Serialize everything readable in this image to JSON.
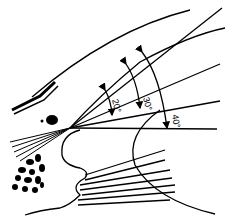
{
  "diagram": {
    "type": "anatomical-angle-diagram",
    "stroke_color": "#000000",
    "background": "#ffffff",
    "angles": [
      {
        "label": "20°",
        "value": 20
      },
      {
        "label": "30°",
        "value": 30
      },
      {
        "label": "40°",
        "value": 40
      }
    ]
  }
}
